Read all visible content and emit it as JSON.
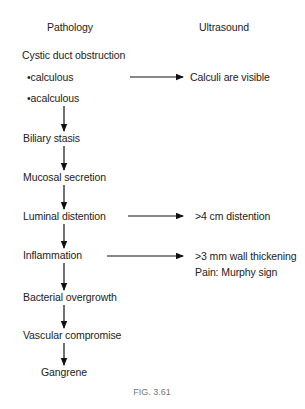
{
  "headers": {
    "left": "Pathology",
    "right": "Ultrasound"
  },
  "pathology_chain": [
    {
      "label": "Cystic duct obstruction",
      "sub_items": [
        "•calculous",
        "•acalculous"
      ]
    },
    {
      "label": "Biliary stasis"
    },
    {
      "label": "Mucosal secretion"
    },
    {
      "label": "Luminal distention"
    },
    {
      "label": "Inflammation"
    },
    {
      "label": "Bacterial overgrowth"
    },
    {
      "label": "Vascular compromise"
    },
    {
      "label": "Gangrene"
    }
  ],
  "ultrasound_findings": [
    {
      "from": "•calculous",
      "text": "Calculi are visible"
    },
    {
      "from": "Luminal distention",
      "text": ">4 cm distention"
    },
    {
      "from": "Inflammation",
      "text": ">3 mm wall thickening",
      "extra": "Pain: Murphy sign"
    }
  ],
  "caption": "FIG. 3.61",
  "colors": {
    "text": "#222222",
    "arrow": "#111111",
    "caption": "#777777",
    "background": "#ffffff"
  }
}
